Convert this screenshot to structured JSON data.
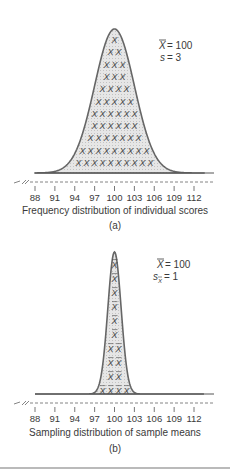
{
  "chart_data": [
    {
      "type": "area",
      "panel": "(a)",
      "title": "Frequency distribution of individual scores",
      "caption": "Frequency distribution of individual scores",
      "panel_label": "(a)",
      "distribution": "normal",
      "mean": 100,
      "sd": 3,
      "annotations": [
        "X̄ = 100",
        "s = 3"
      ],
      "fill_symbol": "X",
      "xlabel": "",
      "ylabel": "",
      "x_ticks": [
        88,
        91,
        94,
        97,
        100,
        103,
        106,
        109,
        112
      ],
      "xlim": [
        88,
        112
      ],
      "axis_break": true,
      "grid": false
    },
    {
      "type": "area",
      "panel": "(b)",
      "title": "Sampling distribution of sample means",
      "caption": "Sampling distribution of sample means",
      "panel_label": "(b)",
      "distribution": "normal",
      "mean": 100,
      "sd": 1,
      "annotations": [
        "X̄ = 100",
        "sX̄ = 1"
      ],
      "fill_symbol": "X̄",
      "xlabel": "",
      "ylabel": "",
      "x_ticks": [
        88,
        91,
        94,
        97,
        100,
        103,
        106,
        109,
        112
      ],
      "xlim": [
        88,
        112
      ],
      "axis_break": true,
      "grid": false
    }
  ],
  "panel_a": {
    "mean_label": "= 100",
    "sd_symbol": "s",
    "sd_label": "= 3",
    "caption": "Frequency distribution of individual scores",
    "panel_label": "(a)",
    "ticks": [
      "88",
      "91",
      "94",
      "97",
      "100",
      "103",
      "106",
      "109",
      "112"
    ]
  },
  "panel_b": {
    "mean_label": "= 100",
    "sd_symbol": "s",
    "sd_label": "= 1",
    "caption": "Sampling distribution of sample means",
    "panel_label": "(b)",
    "ticks": [
      "88",
      "91",
      "94",
      "97",
      "100",
      "103",
      "106",
      "109",
      "112"
    ]
  },
  "colors": {
    "curve_stroke": "#666666",
    "curve_fill": "#dcdcdc",
    "axis": "#555555",
    "text": "#3a3a3a"
  }
}
